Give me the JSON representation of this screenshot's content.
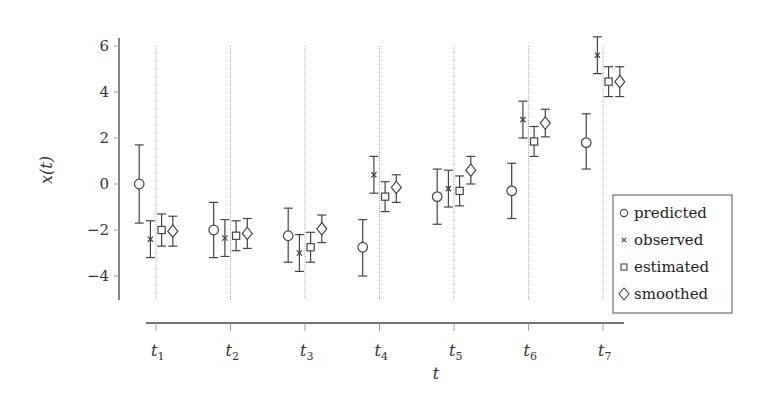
{
  "chart_data": {
    "type": "scatter",
    "title": "",
    "xlabel": "t",
    "ylabel": "x(t)",
    "ylim": [
      -5,
      6.4
    ],
    "yticks": [
      6,
      4,
      2,
      0,
      -2,
      -4
    ],
    "ytick_labels": [
      "6",
      "4",
      "2",
      "0",
      "−2",
      "−4"
    ],
    "categories": [
      "t1",
      "t2",
      "t3",
      "t4",
      "t5",
      "t6",
      "t7"
    ],
    "category_labels": [
      {
        "base": "t",
        "sub": "1"
      },
      {
        "base": "t",
        "sub": "2"
      },
      {
        "base": "t",
        "sub": "3"
      },
      {
        "base": "t",
        "sub": "4"
      },
      {
        "base": "t",
        "sub": "5"
      },
      {
        "base": "t",
        "sub": "6"
      },
      {
        "base": "t",
        "sub": "7"
      }
    ],
    "grid": {
      "vertical_at_categories": true,
      "style": "dotted"
    },
    "legend_position": "right-inside-lower",
    "series": [
      {
        "name": "predicted",
        "marker": "circle",
        "offset": -1.5,
        "values": [
          0.0,
          -2.0,
          -2.25,
          -2.75,
          -0.55,
          -0.3,
          1.8
        ],
        "err_low": [
          -1.7,
          -3.2,
          -3.4,
          -4.0,
          -1.75,
          -1.5,
          0.65
        ],
        "err_high": [
          1.7,
          -0.8,
          -1.05,
          -1.55,
          0.65,
          0.9,
          3.05
        ]
      },
      {
        "name": "observed",
        "marker": "x",
        "offset": -0.5,
        "values": [
          -2.4,
          -2.35,
          -3.0,
          0.4,
          -0.2,
          2.8,
          5.6
        ],
        "err_low": [
          -3.2,
          -3.15,
          -3.8,
          -0.4,
          -1.0,
          2.0,
          4.8
        ],
        "err_high": [
          -1.6,
          -1.55,
          -2.2,
          1.2,
          0.6,
          3.6,
          6.4
        ]
      },
      {
        "name": "estimated",
        "marker": "square",
        "offset": 0.5,
        "values": [
          -2.0,
          -2.25,
          -2.75,
          -0.55,
          -0.3,
          1.85,
          4.45
        ],
        "err_low": [
          -2.7,
          -2.9,
          -3.4,
          -1.2,
          -0.95,
          1.2,
          3.8
        ],
        "err_high": [
          -1.3,
          -1.6,
          -2.1,
          0.1,
          0.35,
          2.5,
          5.1
        ]
      },
      {
        "name": "smoothed",
        "marker": "diamond",
        "offset": 1.5,
        "values": [
          -2.05,
          -2.15,
          -1.95,
          -0.15,
          0.6,
          2.65,
          4.45
        ],
        "err_low": [
          -2.7,
          -2.8,
          -2.55,
          -0.8,
          0.0,
          2.05,
          3.8
        ],
        "err_high": [
          -1.4,
          -1.5,
          -1.35,
          0.4,
          1.2,
          3.25,
          5.1
        ]
      }
    ]
  },
  "legend": {
    "items": [
      {
        "label": "predicted",
        "marker": "circle"
      },
      {
        "label": "observed",
        "marker": "x"
      },
      {
        "label": "estimated",
        "marker": "square"
      },
      {
        "label": "smoothed",
        "marker": "diamond"
      }
    ]
  },
  "colors": {
    "axis": "#444444",
    "grid": "#aaaaaa",
    "marker": "#444444",
    "text": "#333333"
  }
}
